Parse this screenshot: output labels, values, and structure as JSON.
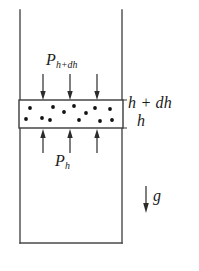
{
  "figure": {
    "type": "physics-diagram",
    "canvas": {
      "width": 199,
      "height": 271
    },
    "colors": {
      "background": "#ffffff",
      "stroke": "#4a4a4a",
      "slab_stroke": "#3a3a3a",
      "arrow": "#2b2b2b",
      "particle": "#111111",
      "text": "#1b1b1b",
      "caption_faint": "#c9c9c9"
    }
  },
  "container": {
    "name": "fluid-column-walls",
    "left_wall_x": 20,
    "right_wall_x": 122,
    "top_y": 10,
    "bottom_y": 243,
    "stroke_width": 1.4
  },
  "slab": {
    "name": "fluid-slab-element",
    "x": 19,
    "y": 100,
    "width": 104,
    "height": 28,
    "stroke_width": 1.4,
    "particle_radius": 1.9,
    "particles": [
      {
        "x": 30,
        "y": 108
      },
      {
        "x": 26,
        "y": 119
      },
      {
        "x": 42,
        "y": 118
      },
      {
        "x": 53,
        "y": 107
      },
      {
        "x": 50,
        "y": 120
      },
      {
        "x": 64,
        "y": 112
      },
      {
        "x": 74,
        "y": 106
      },
      {
        "x": 79,
        "y": 120
      },
      {
        "x": 86,
        "y": 113
      },
      {
        "x": 95,
        "y": 108
      },
      {
        "x": 100,
        "y": 121
      },
      {
        "x": 110,
        "y": 109
      },
      {
        "x": 112,
        "y": 120
      }
    ]
  },
  "arrows": {
    "top_pressure": {
      "name": "pressure-arrows-top",
      "direction": "down",
      "count": 3,
      "x_positions": [
        43,
        70,
        97
      ],
      "y_start": 74,
      "y_end": 99,
      "stroke_width": 1.2,
      "head_width": 5.4,
      "head_length": 8
    },
    "bottom_pressure": {
      "name": "pressure-arrows-bottom",
      "direction": "up",
      "count": 3,
      "x_positions": [
        43,
        70,
        97
      ],
      "y_start": 153,
      "y_end": 130,
      "stroke_width": 1.2,
      "head_width": 5.4,
      "head_length": 8
    },
    "gravity": {
      "name": "gravity-arrow",
      "direction": "down",
      "x": 146,
      "y_start": 186,
      "y_end": 213,
      "stroke_width": 1.2,
      "head_width": 5.6,
      "head_length": 9
    }
  },
  "labels": {
    "pressure_top": {
      "symbol": "P",
      "subscript": "h+dh",
      "full": "P_h+dh"
    },
    "pressure_bottom": {
      "symbol": "P",
      "subscript": "h",
      "full": "P_h"
    },
    "height_top": "h + dh",
    "height_bottom": "h",
    "gravity": "g"
  },
  "caption": {
    "text": "",
    "visible": false,
    "note": "clipped at bottom edge"
  }
}
